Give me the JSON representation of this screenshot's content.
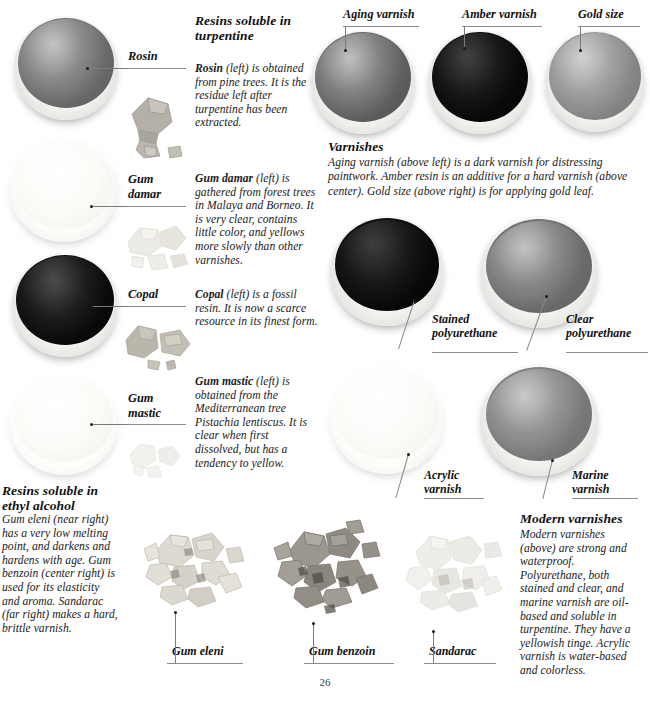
{
  "page": {
    "number": "26",
    "background": "#ffffff"
  },
  "sections": {
    "turpentine": {
      "heading": "Resins soluble in turpentine",
      "paragraphs": [
        {
          "lead": "Rosin",
          "qualifier": "(left) is",
          "text": "obtained from pine trees. It is the residue left after turpentine has been extracted."
        },
        {
          "lead": "Gum damar",
          "qualifier": "(left) is",
          "text": "gathered from forest trees in Malaya and Borneo. It is very clear, contains little color, and yellows more slowly than other varnishes."
        },
        {
          "lead": "Copal",
          "qualifier": "(left) is a fossil",
          "text": "resin. It is now a scarce resource in its finest form."
        },
        {
          "lead": "Gum mastic",
          "qualifier": "(left) is",
          "text": "obtained from the Mediterranean tree Pistachia lentiscus. It is clear when first dissolved, but has a tendency to yellow."
        }
      ]
    },
    "ethyl_alcohol": {
      "heading_line1": "Resins soluble in",
      "heading_line2": "ethyl alcohol",
      "text": "Gum eleni (near right) has a very low melting point, and darkens and hardens with age. Gum benzoin (center right) is used for its elasticity and aroma. Sandarac (far right) makes a hard, brittle varnish."
    },
    "varnishes": {
      "heading": "Varnishes",
      "text": "Aging varnish (above left) is a dark varnish for distressing paintwork. Amber resin is an additive for a hard varnish (above center). Gold size (above right) is for applying gold leaf."
    },
    "modern_varnishes": {
      "heading": "Modern varnishes",
      "text": "Modern varnishes (above) are strong and waterproof. Polyurethane, both stained and clear, and marine varnish are oil-based and soluble in turpentine. They have a yellowish tinge. Acrylic varnish is water-based and colorless."
    }
  },
  "left_column_samples": [
    {
      "label": "Rosin",
      "label_lines": [
        "Rosin"
      ],
      "liquid_color": "#6f6f6f",
      "rim_color": "#f4f3ef"
    },
    {
      "label": "Gum damar",
      "label_lines": [
        "Gum",
        "damar"
      ],
      "liquid_color": "#f7f7f2",
      "rim_color": "#fbfbf8"
    },
    {
      "label": "Copal",
      "label_lines": [
        "Copal"
      ],
      "liquid_color": "#0a0a0a",
      "rim_color": "#f2f1ed"
    },
    {
      "label": "Gum mastic",
      "label_lines": [
        "Gum",
        "mastic"
      ],
      "liquid_color": "#f3f3ee",
      "rim_color": "#fafaf7"
    }
  ],
  "top_right_samples": [
    {
      "label": "Aging varnish",
      "liquid_color": "#5e5e5e"
    },
    {
      "label": "Amber varnish",
      "liquid_color": "#090909"
    },
    {
      "label": "Gold size",
      "liquid_color": "#8a8a8a"
    }
  ],
  "modern_samples": [
    {
      "label_lines": [
        "Stained",
        "polyurethane"
      ],
      "liquid_color": "#0a0a0a"
    },
    {
      "label_lines": [
        "Clear",
        "polyurethane"
      ],
      "liquid_color": "#6f6f6f"
    },
    {
      "label_lines": [
        "Acrylic",
        "varnish"
      ],
      "liquid_color": "#f4f4f0"
    },
    {
      "label_lines": [
        "Marine",
        "varnish"
      ],
      "liquid_color": "#7d7d7d"
    }
  ],
  "bottom_resins": [
    {
      "label": "Gum eleni",
      "tone": "#d9d6cf"
    },
    {
      "label": "Gum benzoin",
      "tone": "#9e9a93"
    },
    {
      "label": "Sandarac",
      "tone": "#ebe9e4"
    }
  ],
  "icons": {
    "leader_dot": "pointer-dot",
    "leader_line": "leader-line"
  }
}
